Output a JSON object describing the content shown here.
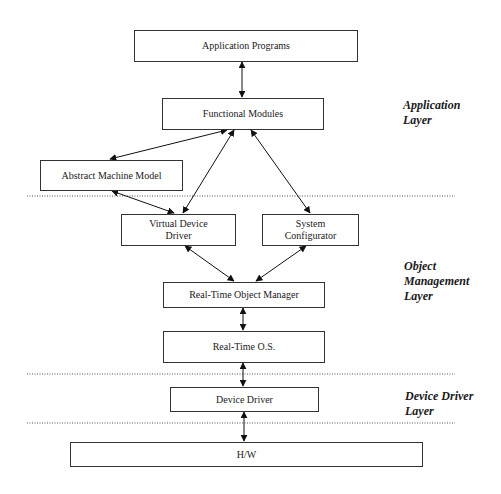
{
  "diagram": {
    "boxes": {
      "app_programs": "Application Programs",
      "functional_modules": "Functional Modules",
      "abstract_machine_model": "Abstract Machine Model",
      "virtual_device_driver": "Virtual Device\nDriver",
      "system_configurator": "System\nConfigurator",
      "rt_object_manager": "Real-Time Object Manager",
      "rt_os": "Real-Time O.S.",
      "device_driver": "Device Driver",
      "hw": "H/W"
    },
    "layers": {
      "application": "Application\nLayer",
      "object_management": "Object\nManagement\nLayer",
      "device_driver": "Device Driver\nLayer"
    },
    "connections": [
      [
        "Application Programs",
        "Functional Modules"
      ],
      [
        "Functional Modules",
        "Abstract Machine Model"
      ],
      [
        "Functional Modules",
        "Virtual Device Driver"
      ],
      [
        "Functional Modules",
        "System Configurator"
      ],
      [
        "Abstract Machine Model",
        "Virtual Device Driver"
      ],
      [
        "Virtual Device Driver",
        "Real-Time Object Manager"
      ],
      [
        "System Configurator",
        "Real-Time Object Manager"
      ],
      [
        "Real-Time Object Manager",
        "Real-Time O.S."
      ],
      [
        "Real-Time O.S.",
        "Device Driver"
      ],
      [
        "Device Driver",
        "H/W"
      ]
    ]
  }
}
